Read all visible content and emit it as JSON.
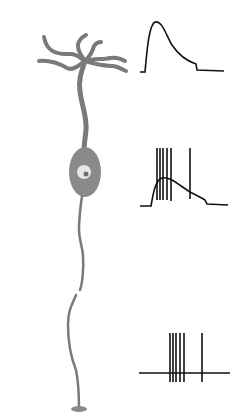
{
  "figure": {
    "colors": {
      "neuron": "#7a7a7a",
      "soma": "#8a8a8a",
      "nucleus": "#e6e6e6",
      "nucleolus": "#6e6e6e",
      "trace": "#111111",
      "background": "#ffffff"
    },
    "traces": [
      {
        "name": "dendritic-epsp",
        "type": "subthreshold potential"
      },
      {
        "name": "soma-potential-with-spikes",
        "spike_count": 6
      },
      {
        "name": "axon-spike-train",
        "spike_count": 6
      }
    ]
  }
}
